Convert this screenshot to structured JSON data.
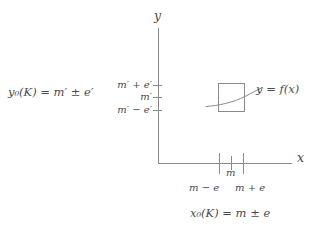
{
  "figure": {
    "type": "math-diagram"
  },
  "equations": {
    "y_range": {
      "lhs_var": "y",
      "lhs_sub": "0",
      "lhs_arg": "(K)",
      "equals": "=",
      "rhs": "m′ ± e′",
      "full": "y₀(K) = m′ ± e′"
    },
    "x_domain": {
      "lhs_var": "x",
      "lhs_sub": "0",
      "lhs_arg": "(K)",
      "equals": "=",
      "rhs": "m ± e",
      "full": "x₀(K) = m ± e"
    }
  },
  "axes": {
    "y_label": "y",
    "x_label": "x",
    "y_ticks": [
      {
        "label": "m′ + e′",
        "value": "m_prime_plus_e_prime",
        "top": 85
      },
      {
        "label": "m′",
        "value": "m_prime",
        "top": 97
      },
      {
        "label": "m′ − e′",
        "value": "m_prime_minus_e_prime",
        "top": 110
      }
    ],
    "x_ticks": [
      {
        "label": "m − e",
        "value": "m_minus_e",
        "left": 219,
        "size": "long"
      },
      {
        "label": "m",
        "value": "m",
        "left": 231,
        "size": "short"
      },
      {
        "label": "m + e",
        "value": "m_plus_e",
        "left": 243,
        "size": "long"
      }
    ]
  },
  "curve": {
    "label": "y = f(x)",
    "box_label": "bounding-box"
  },
  "colors": {
    "ink": "#4a4a4a",
    "line": "#8a8a8a",
    "background": "#ffffff"
  }
}
